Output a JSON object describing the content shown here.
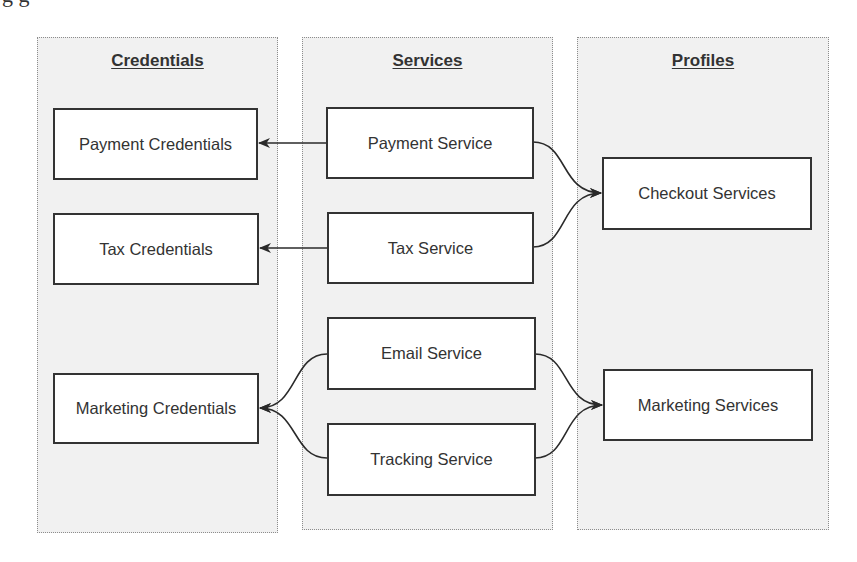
{
  "cropped_title_fragment": "g g",
  "columns": [
    {
      "id": "credentials",
      "header": "Credentials"
    },
    {
      "id": "services",
      "header": "Services"
    },
    {
      "id": "profiles",
      "header": "Profiles"
    }
  ],
  "nodes": {
    "payment_credentials": "Payment Credentials",
    "tax_credentials": "Tax Credentials",
    "marketing_credentials": "Marketing Credentials",
    "payment_service": "Payment Service",
    "tax_service": "Tax Service",
    "email_service": "Email Service",
    "tracking_service": "Tracking Service",
    "checkout_services": "Checkout Services",
    "marketing_services": "Marketing Services"
  },
  "edges": [
    {
      "from": "Payment Service",
      "to": "Payment Credentials"
    },
    {
      "from": "Tax Service",
      "to": "Tax Credentials"
    },
    {
      "from": "Email Service",
      "to": "Marketing Credentials"
    },
    {
      "from": "Tracking Service",
      "to": "Marketing Credentials"
    },
    {
      "from": "Payment Service",
      "to": "Checkout Services"
    },
    {
      "from": "Tax Service",
      "to": "Checkout Services"
    },
    {
      "from": "Email Service",
      "to": "Marketing Services"
    },
    {
      "from": "Tracking Service",
      "to": "Marketing Services"
    }
  ],
  "colors": {
    "column_bg": "#f1f1f1",
    "column_border": "#8c8c8c",
    "node_border": "#333333",
    "edge": "#2a2a2a"
  }
}
